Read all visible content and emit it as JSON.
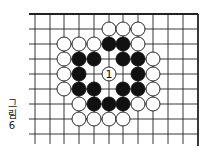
{
  "figure": {
    "caption_line1": "그",
    "caption_line2": "림",
    "caption_line3": "6"
  },
  "board": {
    "columns_x": [
      35,
      50,
      64,
      79,
      94,
      109,
      123,
      138,
      153,
      168,
      183,
      198
    ],
    "rows_y": [
      14,
      29,
      44,
      59,
      74,
      89,
      104,
      119,
      134
    ],
    "top_edge": true,
    "right_edge": true,
    "line_color": "#222222",
    "stone_radius": 7
  },
  "stones": [
    {
      "col": 5,
      "row": 1,
      "color": "white"
    },
    {
      "col": 6,
      "row": 1,
      "color": "white"
    },
    {
      "col": 7,
      "row": 1,
      "color": "white"
    },
    {
      "col": 2,
      "row": 2,
      "color": "white"
    },
    {
      "col": 3,
      "row": 2,
      "color": "white"
    },
    {
      "col": 4,
      "row": 2,
      "color": "white"
    },
    {
      "col": 5,
      "row": 2,
      "color": "black"
    },
    {
      "col": 6,
      "row": 2,
      "color": "black"
    },
    {
      "col": 7,
      "row": 2,
      "color": "white"
    },
    {
      "col": 2,
      "row": 3,
      "color": "white"
    },
    {
      "col": 3,
      "row": 3,
      "color": "black"
    },
    {
      "col": 4,
      "row": 3,
      "color": "black"
    },
    {
      "col": 6,
      "row": 3,
      "color": "black"
    },
    {
      "col": 7,
      "row": 3,
      "color": "black"
    },
    {
      "col": 8,
      "row": 3,
      "color": "white"
    },
    {
      "col": 2,
      "row": 4,
      "color": "white"
    },
    {
      "col": 3,
      "row": 4,
      "color": "black"
    },
    {
      "col": 5,
      "row": 4,
      "color": "white",
      "label": "1"
    },
    {
      "col": 7,
      "row": 4,
      "color": "black"
    },
    {
      "col": 8,
      "row": 4,
      "color": "white"
    },
    {
      "col": 2,
      "row": 5,
      "color": "white"
    },
    {
      "col": 3,
      "row": 5,
      "color": "black"
    },
    {
      "col": 4,
      "row": 5,
      "color": "black"
    },
    {
      "col": 6,
      "row": 5,
      "color": "black"
    },
    {
      "col": 7,
      "row": 5,
      "color": "black"
    },
    {
      "col": 8,
      "row": 5,
      "color": "white"
    },
    {
      "col": 3,
      "row": 6,
      "color": "white"
    },
    {
      "col": 4,
      "row": 6,
      "color": "black"
    },
    {
      "col": 5,
      "row": 6,
      "color": "black"
    },
    {
      "col": 6,
      "row": 6,
      "color": "black"
    },
    {
      "col": 7,
      "row": 6,
      "color": "white"
    },
    {
      "col": 8,
      "row": 6,
      "color": "white"
    },
    {
      "col": 3,
      "row": 7,
      "color": "white"
    },
    {
      "col": 4,
      "row": 7,
      "color": "white"
    },
    {
      "col": 5,
      "row": 7,
      "color": "white"
    },
    {
      "col": 6,
      "row": 7,
      "color": "white"
    }
  ]
}
